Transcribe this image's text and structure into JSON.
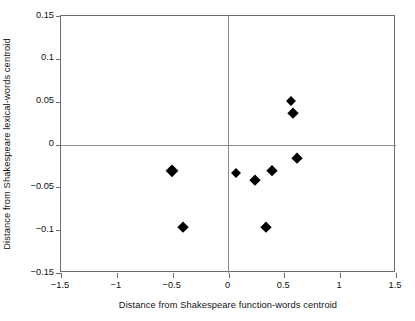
{
  "figure": {
    "ghost_top_text": "",
    "background": "#ffffff",
    "frame_color": "#6e6e6e",
    "zero_line_color": "#8b8b8b",
    "marker_color": "#000000"
  },
  "chart_data": {
    "type": "scatter",
    "title": "",
    "xlabel": "Distance from Shakespeare function-words centroid",
    "ylabel": "Distance from Shakespeare lexical-words centroid",
    "xlim": [
      -1.5,
      1.5
    ],
    "ylim": [
      -0.15,
      0.15
    ],
    "xticks": [
      -1.5,
      -1,
      -0.5,
      0,
      0.5,
      1,
      1.5
    ],
    "xtick_labels": [
      "−1.5",
      "−1",
      "−0.5",
      "0",
      "0.5",
      "1",
      "1.5"
    ],
    "yticks": [
      0.15,
      0.1,
      0.05,
      0,
      -0.05,
      -0.1,
      -0.15
    ],
    "ytick_labels": [
      "0.15",
      "0.1",
      "0.05",
      "0",
      "−0.05",
      "−0.1",
      "−0.15"
    ],
    "grid": false,
    "legend": null,
    "reference_lines": [
      {
        "axis": "x",
        "value": 0
      },
      {
        "axis": "y",
        "value": 0
      }
    ],
    "marker": "diamond",
    "points": [
      {
        "x": -0.51,
        "y": -0.031,
        "size": 13
      },
      {
        "x": -0.41,
        "y": -0.096,
        "size": 11
      },
      {
        "x": 0.07,
        "y": -0.033,
        "size": 10
      },
      {
        "x": 0.24,
        "y": -0.041,
        "size": 11
      },
      {
        "x": 0.39,
        "y": -0.031,
        "size": 12
      },
      {
        "x": 0.34,
        "y": -0.096,
        "size": 11
      },
      {
        "x": 0.56,
        "y": 0.051,
        "size": 10
      },
      {
        "x": 0.58,
        "y": 0.037,
        "size": 11
      },
      {
        "x": 0.61,
        "y": -0.016,
        "size": 11
      }
    ]
  }
}
